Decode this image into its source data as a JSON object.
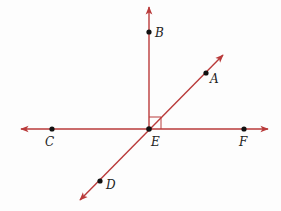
{
  "diagram": {
    "line_color": "#b93a3a",
    "point_color": "#111111",
    "intersection": {
      "name": "E",
      "x": 149,
      "y": 129
    },
    "points": [
      {
        "name": "B",
        "x": 149,
        "y": 32,
        "label_x": 156,
        "label_y": 37
      },
      {
        "name": "A",
        "x": 206,
        "y": 73,
        "label_x": 210,
        "label_y": 82
      },
      {
        "name": "C",
        "x": 52,
        "y": 129,
        "label_x": 46,
        "label_y": 145
      },
      {
        "name": "E",
        "x": 149,
        "y": 129,
        "label_x": 151,
        "label_y": 145
      },
      {
        "name": "F",
        "x": 244,
        "y": 129,
        "label_x": 240,
        "label_y": 145
      },
      {
        "name": "D",
        "x": 100,
        "y": 181,
        "label_x": 106,
        "label_y": 189
      }
    ],
    "rays_lines": [
      {
        "name": "ray-EB",
        "x1": 149,
        "y1": 129,
        "x2": 149,
        "y2": 6
      },
      {
        "name": "line-CF",
        "x1": 20,
        "y1": 129,
        "x2": 269,
        "y2": 129
      },
      {
        "name": "line-DA",
        "x1": 79,
        "y1": 201,
        "x2": 224,
        "y2": 54
      }
    ],
    "right_angle_marker": {
      "x": 149,
      "y": 117,
      "size": 12
    },
    "labels": {
      "A": "A",
      "B": "B",
      "C": "C",
      "D": "D",
      "E": "E",
      "F": "F"
    }
  }
}
